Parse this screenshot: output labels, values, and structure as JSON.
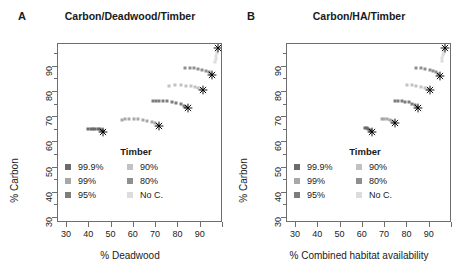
{
  "figure": {
    "width": 458,
    "height": 278,
    "background": "#ffffff"
  },
  "panels": [
    {
      "letter": "A",
      "title": "Carbon/Deadwood/Timber",
      "xlabel": "% Deadwood",
      "ylabel": "% Carbon"
    },
    {
      "letter": "B",
      "title": "Carbon/HA/Timber",
      "xlabel": "% Combined habitat availability",
      "ylabel": "% Carbon"
    }
  ],
  "legend": {
    "title": "Timber",
    "col1": [
      {
        "label": "99.9%",
        "color": "#6b6b6b"
      },
      {
        "label": "99%",
        "color": "#a8a8a8"
      },
      {
        "label": "95%",
        "color": "#7d7d7d"
      }
    ],
    "col2": [
      {
        "label": "90%",
        "color": "#c2c2c2"
      },
      {
        "label": "80%",
        "color": "#8f8f8f"
      },
      {
        "label": "No C.",
        "color": "#dcdcdc"
      }
    ]
  },
  "axes": {
    "x_ticks": [
      30,
      40,
      50,
      60,
      70,
      80,
      90
    ],
    "y_ticks": [
      30,
      40,
      50,
      60,
      70,
      80,
      90
    ],
    "xlim": [
      26,
      100
    ],
    "ylim": [
      28,
      99
    ],
    "grid": false
  },
  "chart_data": {
    "type": "scatter",
    "xlabel": "% Deadwood / % Combined habitat availability",
    "ylabel": "% Carbon",
    "xlim": [
      26,
      100
    ],
    "ylim": [
      28,
      99
    ],
    "grid": false,
    "legend_position": "inside-lower-center",
    "marker_note": "Small square points form arcs; black 8-point asterisk marks the optimum of each series",
    "panels": [
      {
        "letter": "A",
        "title": "Carbon/Deadwood/Timber",
        "xlabel": "% Deadwood",
        "ylabel": "% Carbon",
        "series": [
          {
            "name": "99.9%",
            "color": "#6b6b6b",
            "points": [
              {
                "x": 39.5,
                "y": 65.2
              },
              {
                "x": 40.6,
                "y": 65.3
              },
              {
                "x": 41.7,
                "y": 65.4
              },
              {
                "x": 42.8,
                "y": 65.4
              },
              {
                "x": 43.8,
                "y": 65.3
              },
              {
                "x": 44.7,
                "y": 65.1
              },
              {
                "x": 45.4,
                "y": 64.8
              },
              {
                "x": 46.0,
                "y": 64.4
              }
            ],
            "optimum": {
              "x": 46.4,
              "y": 64.0
            }
          },
          {
            "name": "99%",
            "color": "#a8a8a8",
            "points": [
              {
                "x": 54.5,
                "y": 69.0
              },
              {
                "x": 56.2,
                "y": 69.1
              },
              {
                "x": 58.0,
                "y": 69.2
              },
              {
                "x": 60.0,
                "y": 69.2
              },
              {
                "x": 62.0,
                "y": 69.1
              },
              {
                "x": 64.0,
                "y": 68.9
              },
              {
                "x": 66.0,
                "y": 68.6
              },
              {
                "x": 68.0,
                "y": 68.2
              },
              {
                "x": 69.6,
                "y": 67.6
              },
              {
                "x": 70.7,
                "y": 67.0
              }
            ],
            "optimum": {
              "x": 71.4,
              "y": 66.6
            }
          },
          {
            "name": "95%",
            "color": "#7d7d7d",
            "points": [
              {
                "x": 68.5,
                "y": 76.3
              },
              {
                "x": 70.0,
                "y": 76.4
              },
              {
                "x": 71.5,
                "y": 76.4
              },
              {
                "x": 73.0,
                "y": 76.3
              },
              {
                "x": 75.0,
                "y": 76.2
              },
              {
                "x": 77.0,
                "y": 76.0
              },
              {
                "x": 79.0,
                "y": 75.7
              },
              {
                "x": 81.0,
                "y": 75.2
              },
              {
                "x": 82.5,
                "y": 74.6
              },
              {
                "x": 83.6,
                "y": 74.0
              }
            ],
            "optimum": {
              "x": 84.3,
              "y": 73.6
            }
          },
          {
            "name": "90%",
            "color": "#c2c2c2",
            "points": [
              {
                "x": 76.0,
                "y": 82.5
              },
              {
                "x": 78.5,
                "y": 82.6
              },
              {
                "x": 81.0,
                "y": 82.6
              },
              {
                "x": 83.5,
                "y": 82.5
              },
              {
                "x": 85.5,
                "y": 82.3
              },
              {
                "x": 87.5,
                "y": 82.0
              },
              {
                "x": 89.0,
                "y": 81.6
              },
              {
                "x": 90.2,
                "y": 81.1
              }
            ],
            "optimum": {
              "x": 91.0,
              "y": 80.7
            }
          },
          {
            "name": "80%",
            "color": "#8f8f8f",
            "points": [
              {
                "x": 83.0,
                "y": 89.4
              },
              {
                "x": 85.0,
                "y": 89.4
              },
              {
                "x": 87.0,
                "y": 89.3
              },
              {
                "x": 89.0,
                "y": 89.1
              },
              {
                "x": 90.8,
                "y": 88.8
              },
              {
                "x": 92.3,
                "y": 88.4
              },
              {
                "x": 93.5,
                "y": 87.8
              },
              {
                "x": 94.4,
                "y": 87.2
              }
            ],
            "optimum": {
              "x": 95.0,
              "y": 86.7
            }
          },
          {
            "name": "No C.",
            "color": "#dcdcdc",
            "points": [
              {
                "x": 96.5,
                "y": 92.0
              },
              {
                "x": 96.8,
                "y": 93.2
              },
              {
                "x": 97.0,
                "y": 94.4
              },
              {
                "x": 97.2,
                "y": 95.5
              },
              {
                "x": 97.4,
                "y": 96.4
              },
              {
                "x": 97.6,
                "y": 97.1
              }
            ],
            "optimum": {
              "x": 97.8,
              "y": 97.6
            }
          }
        ]
      },
      {
        "letter": "B",
        "title": "Carbon/HA/Timber",
        "xlabel": "% Combined habitat availability",
        "ylabel": "% Carbon",
        "series": [
          {
            "name": "99.9%",
            "color": "#6b6b6b",
            "points": [
              {
                "x": 61.0,
                "y": 65.8
              },
              {
                "x": 61.8,
                "y": 65.6
              },
              {
                "x": 62.5,
                "y": 65.3
              },
              {
                "x": 63.2,
                "y": 64.9
              },
              {
                "x": 63.8,
                "y": 64.5
              }
            ],
            "optimum": {
              "x": 64.3,
              "y": 64.1
            }
          },
          {
            "name": "99%",
            "color": "#a8a8a8",
            "points": [
              {
                "x": 68.5,
                "y": 69.2
              },
              {
                "x": 69.6,
                "y": 69.2
              },
              {
                "x": 70.8,
                "y": 69.1
              },
              {
                "x": 72.0,
                "y": 68.9
              },
              {
                "x": 73.0,
                "y": 68.5
              },
              {
                "x": 73.8,
                "y": 68.1
              }
            ],
            "optimum": {
              "x": 74.4,
              "y": 67.7
            }
          },
          {
            "name": "95%",
            "color": "#7d7d7d",
            "points": [
              {
                "x": 74.5,
                "y": 76.4
              },
              {
                "x": 76.0,
                "y": 76.4
              },
              {
                "x": 77.5,
                "y": 76.3
              },
              {
                "x": 79.0,
                "y": 76.1
              },
              {
                "x": 80.5,
                "y": 75.8
              },
              {
                "x": 82.0,
                "y": 75.3
              },
              {
                "x": 83.2,
                "y": 74.7
              },
              {
                "x": 84.1,
                "y": 74.1
              }
            ],
            "optimum": {
              "x": 84.8,
              "y": 73.6
            }
          },
          {
            "name": "90%",
            "color": "#c2c2c2",
            "points": [
              {
                "x": 80.0,
                "y": 82.6
              },
              {
                "x": 82.0,
                "y": 82.6
              },
              {
                "x": 84.0,
                "y": 82.4
              },
              {
                "x": 86.0,
                "y": 82.1
              },
              {
                "x": 87.8,
                "y": 81.7
              },
              {
                "x": 89.2,
                "y": 81.2
              }
            ],
            "optimum": {
              "x": 90.2,
              "y": 80.7
            }
          },
          {
            "name": "80%",
            "color": "#8f8f8f",
            "points": [
              {
                "x": 84.0,
                "y": 89.4
              },
              {
                "x": 86.0,
                "y": 89.3
              },
              {
                "x": 88.0,
                "y": 89.1
              },
              {
                "x": 90.0,
                "y": 88.8
              },
              {
                "x": 91.6,
                "y": 88.3
              },
              {
                "x": 92.9,
                "y": 87.7
              },
              {
                "x": 93.9,
                "y": 87.1
              }
            ],
            "optimum": {
              "x": 94.6,
              "y": 86.5
            }
          },
          {
            "name": "No C.",
            "color": "#dcdcdc",
            "points": [
              {
                "x": 95.4,
                "y": 92.2
              },
              {
                "x": 95.7,
                "y": 93.4
              },
              {
                "x": 96.0,
                "y": 94.5
              },
              {
                "x": 96.3,
                "y": 95.5
              },
              {
                "x": 96.6,
                "y": 96.3
              },
              {
                "x": 96.8,
                "y": 97.0
              }
            ],
            "optimum": {
              "x": 97.0,
              "y": 97.5
            }
          }
        ]
      }
    ]
  }
}
